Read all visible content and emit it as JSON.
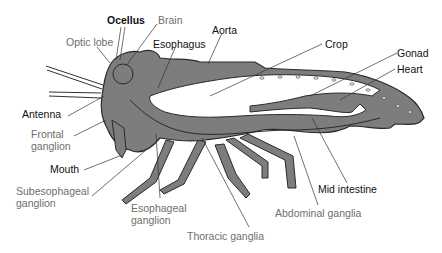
{
  "diagram": {
    "colors": {
      "body_fill": "#7d7d7d",
      "outline": "#2a2a2a",
      "gut_fill": "#ffffff",
      "label_dark": "#111111",
      "label_gray": "#6e6e6e"
    },
    "labels": {
      "ocellus": "Ocellus",
      "brain": "Brain",
      "optic_lobe": "Optic lobe",
      "esophagus": "Esophagus",
      "aorta": "Aorta",
      "crop": "Crop",
      "gonad": "Gonad",
      "heart": "Heart",
      "antenna": "Antenna",
      "frontal_ganglion_1": "Frontal",
      "frontal_ganglion_2": "ganglion",
      "mouth": "Mouth",
      "subesophageal_ganglion_1": "Subesophageal",
      "subesophageal_ganglion_2": "ganglion",
      "esophageal_ganglion_1": "Esophageal",
      "esophageal_ganglion_2": "ganglion",
      "thoracic_ganglia": "Thoracic ganglia",
      "abdominal_ganglia": "Abdominal ganglia",
      "mid_intestine": "Mid intestine"
    },
    "label_groups": {
      "dark": [
        "Ocellus",
        "Esophagus",
        "Aorta",
        "Crop",
        "Gonad",
        "Heart",
        "Antenna",
        "Mouth",
        "Mid intestine"
      ],
      "gray_nervous_system": [
        "Brain",
        "Optic lobe",
        "Frontal ganglion",
        "Subesophageal ganglion",
        "Esophageal ganglion",
        "Thoracic ganglia",
        "Abdominal ganglia"
      ]
    }
  }
}
